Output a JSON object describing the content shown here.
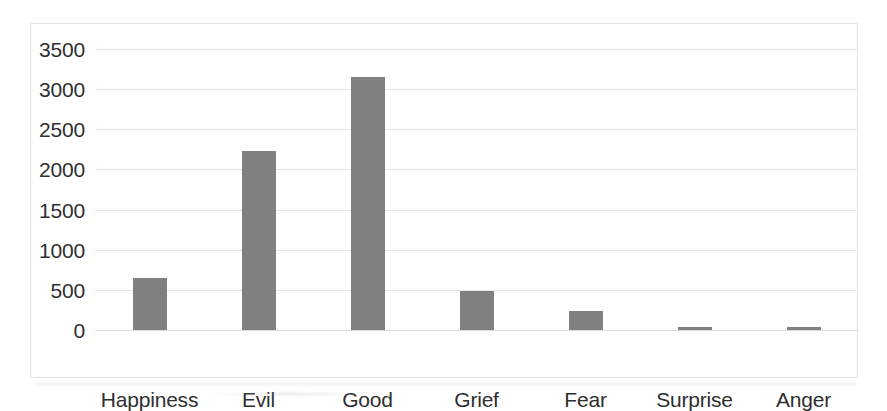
{
  "chart_data": {
    "type": "bar",
    "title": "",
    "subtitle": "",
    "xlabel": "",
    "ylabel": "",
    "categories": [
      "Happiness",
      "Evil",
      "Good",
      "Grief",
      "Fear",
      "Surprise",
      "Anger"
    ],
    "values": [
      650,
      2230,
      3150,
      480,
      240,
      40,
      40
    ],
    "series": [
      {
        "name": "",
        "values": [
          650,
          2230,
          3150,
          480,
          240,
          40,
          40
        ]
      }
    ],
    "ylim": [
      0,
      3500
    ],
    "y_ticks": [
      0,
      500,
      1000,
      1500,
      2000,
      2500,
      3000,
      3500
    ],
    "y_tick_labels": [
      "0",
      "500",
      "1000",
      "1500",
      "2000",
      "2500",
      "3000",
      "3500"
    ],
    "grid": true,
    "legend": false,
    "legend_position": "none",
    "bar_color": "#808080",
    "gridline_color": "#e6e6e6",
    "frame_color": "#e2e2e2",
    "text_color": "#2f2f2f",
    "background": "#ffffff",
    "annotations": []
  }
}
